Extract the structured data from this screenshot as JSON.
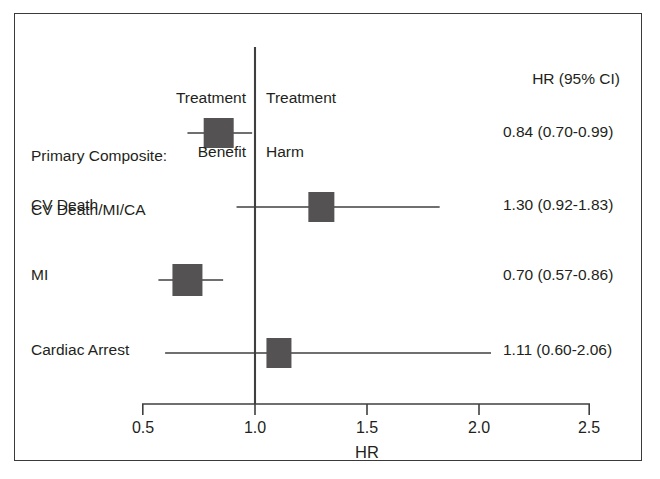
{
  "figure": {
    "type": "forest-plot",
    "axis_title": "HR",
    "header_left_line1": "Treatment",
    "header_left_line2": "Benefit",
    "header_right_line1": "Treatment",
    "header_right_line2": "Harm",
    "value_column_header": "HR (95% CI)",
    "line_color": "#3f3f3f",
    "marker_color": "#555253",
    "frame_color": "#3a3a3a",
    "text_color": "#231f20"
  },
  "chart_data": {
    "type": "scatter",
    "title": "",
    "xlabel": "HR",
    "ylabel": "",
    "xlim": [
      0.5,
      2.5
    ],
    "xticks": [
      0.5,
      1.0,
      1.5,
      2.0,
      2.5
    ],
    "xtick_labels": [
      "0.5",
      "1.0",
      "1.5",
      "2.0",
      "2.5"
    ],
    "grid": false,
    "reference_line_x": 1.0,
    "legend": "none",
    "annotations": [
      "Treatment Benefit",
      "Treatment Harm"
    ],
    "categories": [
      "Primary Composite: CV Death/MI/CA",
      "CV Death",
      "MI",
      "Cardiac Arrest"
    ],
    "values": [
      0.84,
      1.3,
      0.7,
      1.11
    ],
    "ci_low": [
      0.7,
      0.92,
      0.57,
      0.6
    ],
    "ci_high": [
      0.99,
      1.83,
      0.86,
      2.06
    ],
    "rows": [
      {
        "label_line1": "Primary Composite:",
        "label_line2": "CV Death/MI/CA",
        "hr": 0.84,
        "ci_low": 0.7,
        "ci_high": 0.99,
        "value_text": "0.84 (0.70-0.99)"
      },
      {
        "label_line1": "CV Death",
        "label_line2": "",
        "hr": 1.3,
        "ci_low": 0.92,
        "ci_high": 1.83,
        "value_text": "1.30 (0.92-1.83)"
      },
      {
        "label_line1": "MI",
        "label_line2": "",
        "hr": 0.7,
        "ci_low": 0.57,
        "ci_high": 0.86,
        "value_text": "0.70 (0.57-0.86)"
      },
      {
        "label_line1": "Cardiac Arrest",
        "label_line2": "",
        "hr": 1.11,
        "ci_low": 0.6,
        "ci_high": 2.06,
        "value_text": "1.11 (0.60-2.06)"
      }
    ]
  }
}
